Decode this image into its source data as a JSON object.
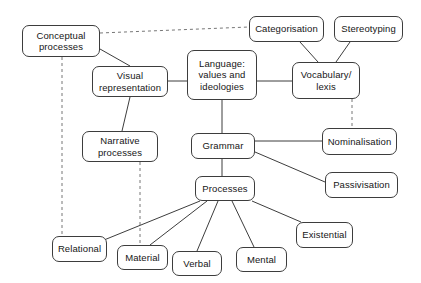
{
  "diagram": {
    "canvas": {
      "width": 421,
      "height": 283
    },
    "style": {
      "background_color": "#ffffff",
      "node_fill": "#ffffff",
      "node_stroke": "#3d3d3d",
      "text_color": "#161616",
      "solid_edge_color": "#3d3d3d",
      "dashed_edge_color": "#777777"
    },
    "nodes": [
      {
        "id": "conceptual",
        "label": "Conceptual\nprocesses",
        "x": 22,
        "y": 25,
        "w": 78,
        "h": 32
      },
      {
        "id": "categorisation",
        "label": "Categorisation",
        "x": 249,
        "y": 16,
        "w": 75,
        "h": 26
      },
      {
        "id": "stereotyping",
        "label": "Stereotyping",
        "x": 334,
        "y": 16,
        "w": 69,
        "h": 26
      },
      {
        "id": "visual",
        "label": "Visual\nrepresentation",
        "x": 92,
        "y": 66,
        "w": 76,
        "h": 31
      },
      {
        "id": "language",
        "label": "Language:\nvalues and\nideologies",
        "x": 187,
        "y": 50,
        "w": 70,
        "h": 50
      },
      {
        "id": "vocabulary",
        "label": "Vocabulary/\nlexis",
        "x": 292,
        "y": 62,
        "w": 68,
        "h": 37
      },
      {
        "id": "narrative",
        "label": "Narrative\nprocesses",
        "x": 82,
        "y": 131,
        "w": 76,
        "h": 31
      },
      {
        "id": "grammar",
        "label": "Grammar",
        "x": 191,
        "y": 133,
        "w": 64,
        "h": 26
      },
      {
        "id": "nominalisation",
        "label": "Nominalisation",
        "x": 322,
        "y": 128,
        "w": 75,
        "h": 27
      },
      {
        "id": "passivisation",
        "label": "Passivisation",
        "x": 325,
        "y": 172,
        "w": 73,
        "h": 26
      },
      {
        "id": "processes",
        "label": "Processes",
        "x": 195,
        "y": 176,
        "w": 60,
        "h": 25
      },
      {
        "id": "existential",
        "label": "Existential",
        "x": 296,
        "y": 222,
        "w": 57,
        "h": 26
      },
      {
        "id": "relational",
        "label": "Relational",
        "x": 52,
        "y": 236,
        "w": 55,
        "h": 26
      },
      {
        "id": "material",
        "label": "Material",
        "x": 117,
        "y": 245,
        "w": 51,
        "h": 25
      },
      {
        "id": "mental",
        "label": "Mental",
        "x": 236,
        "y": 247,
        "w": 51,
        "h": 25
      },
      {
        "id": "verbal",
        "label": "Verbal",
        "x": 172,
        "y": 251,
        "w": 50,
        "h": 25
      }
    ],
    "edges": [
      {
        "from": "conceptual",
        "to": "categorisation",
        "style": "dashed",
        "x1": 100,
        "y1": 33,
        "x2": 249,
        "y2": 27
      },
      {
        "from": "conceptual",
        "to": "visual",
        "style": "solid",
        "x1": 100,
        "y1": 49,
        "x2": 130,
        "y2": 66
      },
      {
        "from": "conceptual",
        "to": "relational",
        "style": "dashed",
        "x1": 62,
        "y1": 57,
        "x2": 62,
        "y2": 236
      },
      {
        "from": "categorisation",
        "to": "vocabulary",
        "style": "solid",
        "x1": 300,
        "y1": 42,
        "x2": 318,
        "y2": 62
      },
      {
        "from": "stereotyping",
        "to": "vocabulary",
        "style": "solid",
        "x1": 350,
        "y1": 42,
        "x2": 336,
        "y2": 62
      },
      {
        "from": "visual",
        "to": "language",
        "style": "solid",
        "x1": 168,
        "y1": 81,
        "x2": 187,
        "y2": 81
      },
      {
        "from": "visual",
        "to": "narrative",
        "style": "solid",
        "x1": 130,
        "y1": 97,
        "x2": 122,
        "y2": 131
      },
      {
        "from": "language",
        "to": "vocabulary",
        "style": "solid",
        "x1": 257,
        "y1": 81,
        "x2": 292,
        "y2": 81
      },
      {
        "from": "language",
        "to": "grammar",
        "style": "solid",
        "x1": 222,
        "y1": 100,
        "x2": 222,
        "y2": 133
      },
      {
        "from": "vocabulary",
        "to": "nominalisation",
        "style": "dashed",
        "x1": 352,
        "y1": 99,
        "x2": 352,
        "y2": 128
      },
      {
        "from": "narrative",
        "to": "material",
        "style": "dashed",
        "x1": 140,
        "y1": 162,
        "x2": 140,
        "y2": 245
      },
      {
        "from": "grammar",
        "to": "nominalisation",
        "style": "solid",
        "x1": 255,
        "y1": 141,
        "x2": 322,
        "y2": 141
      },
      {
        "from": "grammar",
        "to": "passivisation",
        "style": "solid",
        "x1": 255,
        "y1": 152,
        "x2": 325,
        "y2": 182
      },
      {
        "from": "grammar",
        "to": "processes",
        "style": "solid",
        "x1": 222,
        "y1": 159,
        "x2": 222,
        "y2": 176
      },
      {
        "from": "processes",
        "to": "existential",
        "style": "solid",
        "x1": 252,
        "y1": 201,
        "x2": 301,
        "y2": 222
      },
      {
        "from": "processes",
        "to": "relational",
        "style": "solid",
        "x1": 200,
        "y1": 201,
        "x2": 104,
        "y2": 240
      },
      {
        "from": "processes",
        "to": "material",
        "style": "solid",
        "x1": 207,
        "y1": 201,
        "x2": 150,
        "y2": 245
      },
      {
        "from": "processes",
        "to": "verbal",
        "style": "solid",
        "x1": 218,
        "y1": 201,
        "x2": 197,
        "y2": 251
      },
      {
        "from": "processes",
        "to": "mental",
        "style": "solid",
        "x1": 232,
        "y1": 201,
        "x2": 254,
        "y2": 247
      }
    ]
  }
}
